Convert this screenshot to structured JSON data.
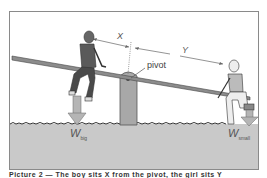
{
  "figure": {
    "labels": {
      "x": "X",
      "y": "Y",
      "pivot": "pivot",
      "w_big_main": "W",
      "w_big_sub": "big",
      "w_small_main": "W",
      "w_small_sub": "small"
    },
    "colors": {
      "ground": "#c9c9c9",
      "beam": "#8c8c8c",
      "post": "#a8a8a8",
      "arrow": "#b5b5b5",
      "frame": "#8a8a8a"
    },
    "icons": [
      "boy-figure",
      "girl-figure",
      "seesaw-beam",
      "pivot-post",
      "weight-arrow-down"
    ]
  },
  "caption": {
    "text": "Picture 2 — The boy sits X from the pivot, the girl sits Y"
  }
}
